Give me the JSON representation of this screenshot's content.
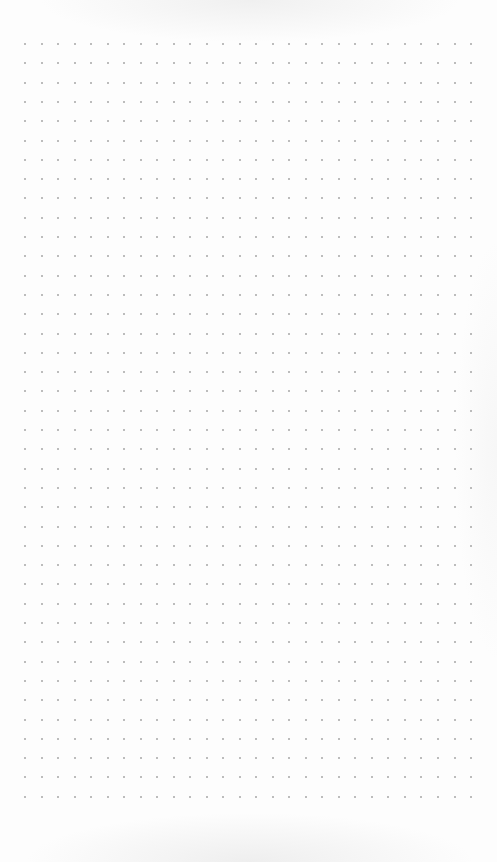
{
  "page": {
    "type": "dot-grid-paper",
    "background_color": "#fdfdfd",
    "dot_color": "#a6a6a6"
  },
  "grid": {
    "origin_x": 25,
    "origin_y": 44,
    "spacing_x": 16.52,
    "spacing_y": 19.3,
    "columns": 28,
    "rows": 40,
    "dot_size": 2
  }
}
